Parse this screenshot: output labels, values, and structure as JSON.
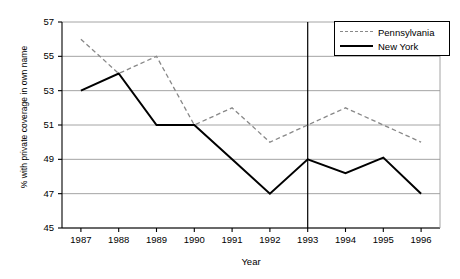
{
  "chart_data": {
    "type": "line",
    "title": "",
    "subtitle": "",
    "xlabel": "Year",
    "ylabel": "% with private coverage in own name",
    "x": [
      1987,
      1988,
      1989,
      1990,
      1991,
      1992,
      1993,
      1994,
      1995,
      1996
    ],
    "xtick_labels": [
      "1987",
      "1988",
      "1989",
      "1990",
      "1991",
      "1992",
      "1993",
      "1994",
      "1995",
      "1996"
    ],
    "ytick_labels": [
      "45",
      "47",
      "49",
      "51",
      "53",
      "55",
      "57"
    ],
    "ytick_values": [
      45,
      47,
      49,
      51,
      53,
      55,
      57
    ],
    "xlim": [
      1986.5,
      1996.5
    ],
    "ylim": [
      45,
      57
    ],
    "grid": "horizontal",
    "legend_position": "top-right",
    "series": [
      {
        "name": "Pennsylvania",
        "style": "dashed",
        "color": "#888888",
        "values": [
          56,
          54,
          55,
          51,
          52,
          50,
          51,
          52,
          51,
          50
        ]
      },
      {
        "name": "New York",
        "style": "solid",
        "color": "#000000",
        "values": [
          53,
          54,
          51,
          51,
          49,
          47,
          49,
          48.2,
          49.1,
          47
        ]
      }
    ],
    "annotations": [
      {
        "type": "vertical-reference-line",
        "x": 1993,
        "color": "#000000"
      }
    ]
  },
  "legend": {
    "items": [
      {
        "label": "Pennsylvania"
      },
      {
        "label": "New York"
      }
    ]
  }
}
